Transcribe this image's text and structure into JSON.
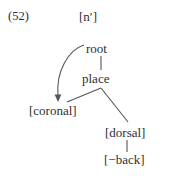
{
  "figure": {
    "example_number": "(52)",
    "segment_label": "[n′]",
    "type": "feature-geometry-tree"
  },
  "tree": {
    "nodes": [
      {
        "id": "root",
        "label": "root"
      },
      {
        "id": "place",
        "label": "place"
      },
      {
        "id": "coronal",
        "label": "[coronal]"
      },
      {
        "id": "dorsal",
        "label": "[dorsal]"
      },
      {
        "id": "back",
        "label": "[−back]"
      }
    ],
    "edges": [
      {
        "from": "root",
        "to": "place",
        "style": "vertical-line"
      },
      {
        "from": "place",
        "to": "coronal",
        "style": "diagonal-line"
      },
      {
        "from": "place",
        "to": "dorsal",
        "style": "diagonal-line"
      },
      {
        "from": "dorsal",
        "to": "back",
        "style": "vertical-line"
      }
    ],
    "association": {
      "from": "root",
      "to": "coronal",
      "style": "curved-arrow",
      "description": "spreading arrow from root to [coronal]"
    }
  },
  "colors": {
    "ink": "#2e2e2e",
    "line": "#55555a",
    "background": "#ffffff"
  }
}
